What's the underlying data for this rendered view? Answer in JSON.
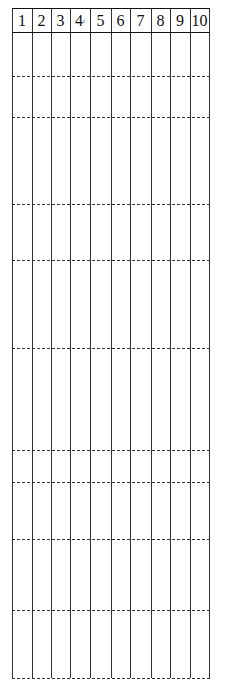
{
  "diagram": {
    "columns": [
      {
        "label": "1"
      },
      {
        "label": "2"
      },
      {
        "label": "3"
      },
      {
        "label": "4",
        "mark": "i"
      },
      {
        "label": "5"
      },
      {
        "label": "6"
      },
      {
        "label": "7"
      },
      {
        "label": "8"
      },
      {
        "label": "9"
      },
      {
        "label": "10"
      }
    ],
    "column_edges": [
      12,
      32,
      51,
      70,
      90,
      111,
      130,
      151,
      170,
      190,
      209
    ],
    "header_top": 8,
    "header_bottom": 32,
    "dashed_rows_y": [
      76,
      117,
      204,
      260,
      348,
      450,
      482,
      539,
      610
    ],
    "bottom_y": 678,
    "line_color": "#333333"
  }
}
